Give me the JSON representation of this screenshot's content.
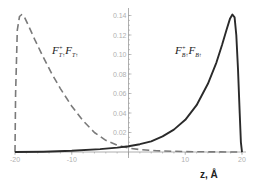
{
  "chart_data": {
    "type": "line",
    "title": "",
    "xlabel": "z, Å",
    "ylabel": "",
    "xlim": [
      -20,
      20
    ],
    "ylim": [
      0,
      0.145
    ],
    "grid": false,
    "legend": "none (inline curve labels)",
    "x_ticks": [
      -20,
      -10,
      0,
      10,
      20
    ],
    "x_tick_labels": [
      "-20",
      "-10",
      "",
      "10",
      "20"
    ],
    "y_ticks": [
      0.02,
      0.04,
      0.06,
      0.08,
      0.1,
      0.12,
      0.14
    ],
    "y_tick_labels": [
      "0.02",
      "0.04",
      "0.06",
      "0.08",
      "0.10",
      "0.12",
      "0.14"
    ],
    "series": [
      {
        "name": "F_T↑^+ F_T↑",
        "label_main": "F",
        "label_sup": "+",
        "label_sub": "T↑",
        "label_main2": "F",
        "label_sub2": "T↑",
        "style": "dashed",
        "color": "#7a7a7a",
        "x": [
          -20,
          -19.9,
          -19.6,
          -19.2,
          -18.8,
          -18.3,
          -17.5,
          -16.5,
          -15,
          -13.5,
          -12,
          -10,
          -8,
          -6,
          -4,
          -2,
          0,
          2,
          5,
          10,
          15,
          20
        ],
        "y": [
          0,
          0.06,
          0.125,
          0.139,
          0.141,
          0.138,
          0.128,
          0.115,
          0.097,
          0.08,
          0.065,
          0.047,
          0.032,
          0.02,
          0.012,
          0.007,
          0.004,
          0.0025,
          0.0012,
          0.0004,
          0.0001,
          0
        ]
      },
      {
        "name": "F_B↑^+ F_B↑",
        "label_main": "F",
        "label_sup": "+",
        "label_sub": "B↑",
        "label_main2": "F",
        "label_sub2": "B↑",
        "style": "solid",
        "color": "#2a2a2a",
        "x": [
          -20,
          -15,
          -10,
          -5,
          -2,
          0,
          2,
          4,
          6,
          8,
          10,
          12,
          14,
          15.5,
          16.5,
          17.3,
          17.9,
          18.3,
          18.7,
          19.0,
          19.3,
          19.6,
          19.8,
          20
        ],
        "y": [
          0,
          0.0003,
          0.0012,
          0.003,
          0.0045,
          0.006,
          0.008,
          0.011,
          0.016,
          0.023,
          0.033,
          0.048,
          0.07,
          0.092,
          0.11,
          0.126,
          0.137,
          0.141,
          0.138,
          0.12,
          0.085,
          0.04,
          0.01,
          0
        ]
      }
    ]
  }
}
